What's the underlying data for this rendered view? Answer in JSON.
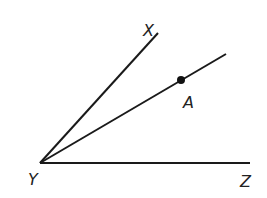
{
  "diagram": {
    "title": "",
    "vertex": {
      "name": "Y",
      "x": 40,
      "y": 163,
      "label_x": 28,
      "label_y": 185
    },
    "rays": [
      {
        "id": "YX",
        "end_x": 158,
        "end_y": 33,
        "label": "X",
        "label_x": 143,
        "label_y": 36
      },
      {
        "id": "YA",
        "end_x": 226,
        "end_y": 54,
        "label": "",
        "label_x": 0,
        "label_y": 0
      },
      {
        "id": "YZ",
        "end_x": 250,
        "end_y": 163,
        "label": "Z",
        "label_x": 240,
        "label_y": 187
      }
    ],
    "points": [
      {
        "name": "A",
        "x": 181,
        "y": 80,
        "r": 4,
        "label": "A",
        "label_x": 183,
        "label_y": 108
      }
    ],
    "labels": {
      "X": "X",
      "Y": "Y",
      "Z": "Z",
      "A": "A"
    },
    "colors": {
      "line": "#1a1a1a",
      "background": "#ffffff"
    }
  }
}
